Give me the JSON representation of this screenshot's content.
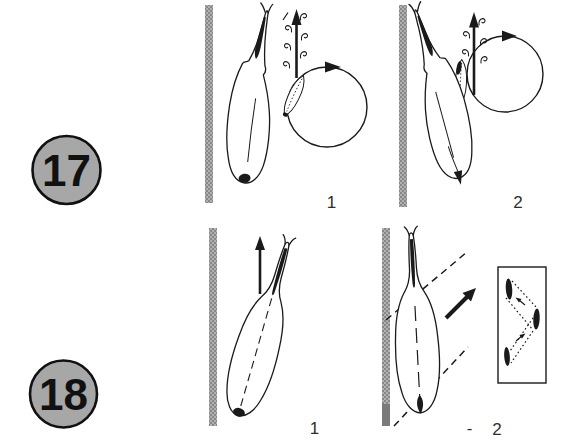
{
  "figure_type": "ethology-display-diagram",
  "badges": {
    "top": "17",
    "bottom": "18"
  },
  "panels": {
    "p17_1": {
      "label": "1"
    },
    "p17_2": {
      "label": "2"
    },
    "p18_1": {
      "label": "1"
    },
    "p18_2": {
      "label": "2"
    }
  },
  "stray_mark": "-",
  "colors": {
    "background": "#ffffff",
    "ink": "#1a1a1a",
    "badge_fill": "#a7a7a7",
    "wall_gray": "#979797",
    "wall_gray_dark": "#7a7a7a"
  }
}
